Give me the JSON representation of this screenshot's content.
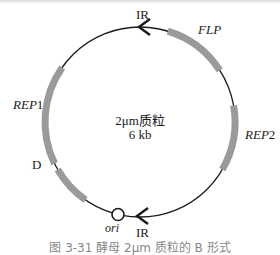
{
  "figure": {
    "title": "2μm质粒",
    "size": "6 kb",
    "caption": "图 3-31  酵母 2μm 质粒的 B 形式",
    "colors": {
      "backbone": "#1a1a1a",
      "gene": "#9a9a9a",
      "ori_fill": "#ffffff"
    }
  },
  "labels": {
    "ir_top": "IR",
    "ir_bottom": "IR",
    "flp": "FLP",
    "rep2": "REP2",
    "rep1": "REP",
    "rep1_num": "1",
    "rep2_base": "REP",
    "rep2_num": "2",
    "d": "D",
    "ori": "ori"
  },
  "elements": [
    {
      "name": "IR",
      "type": "inverted-repeat-arrow",
      "position": "top"
    },
    {
      "name": "FLP",
      "type": "gene",
      "arc_deg": [
        17,
        57
      ]
    },
    {
      "name": "REP2",
      "type": "gene",
      "arc_deg": [
        80,
        120
      ]
    },
    {
      "name": "IR",
      "type": "inverted-repeat-arrow",
      "position": "bottom"
    },
    {
      "name": "ori",
      "type": "origin"
    },
    {
      "name": "D",
      "type": "gene",
      "arc_deg": [
        215,
        240
      ]
    },
    {
      "name": "REP1",
      "type": "gene",
      "arc_deg": [
        244,
        305
      ]
    }
  ]
}
